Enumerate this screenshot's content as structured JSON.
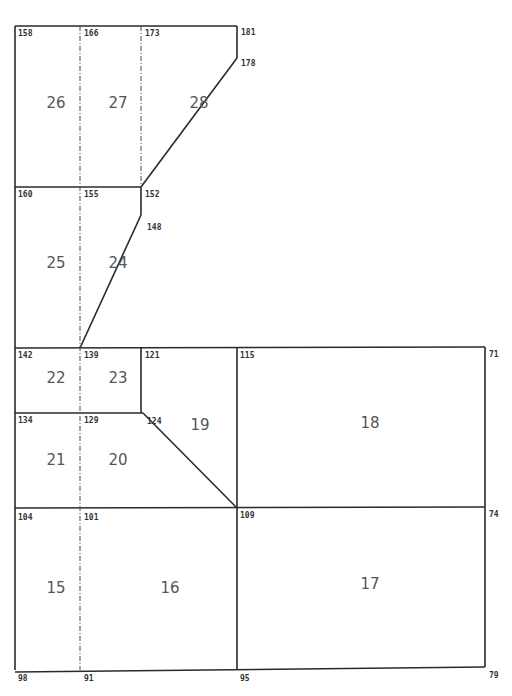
{
  "figure": {
    "type": "finite-element mesh diagram",
    "stroke_color": "#2a2a2a",
    "background": "#ffffff",
    "caption_partial": ""
  },
  "solid_edges": [
    {
      "x1": 15,
      "y1": 26,
      "x2": 237,
      "y2": 26
    },
    {
      "x1": 237,
      "y1": 26,
      "x2": 237,
      "y2": 58
    },
    {
      "x1": 237,
      "y1": 58,
      "x2": 141,
      "y2": 187
    },
    {
      "x1": 15,
      "y1": 26,
      "x2": 15,
      "y2": 670
    },
    {
      "x1": 15,
      "y1": 187,
      "x2": 141,
      "y2": 187
    },
    {
      "x1": 141,
      "y1": 187,
      "x2": 141,
      "y2": 215
    },
    {
      "x1": 141,
      "y1": 215,
      "x2": 80,
      "y2": 348
    },
    {
      "x1": 15,
      "y1": 348,
      "x2": 485,
      "y2": 347
    },
    {
      "x1": 15,
      "y1": 413,
      "x2": 143,
      "y2": 413
    },
    {
      "x1": 141,
      "y1": 348,
      "x2": 141,
      "y2": 413
    },
    {
      "x1": 143,
      "y1": 413,
      "x2": 237,
      "y2": 508
    },
    {
      "x1": 15,
      "y1": 508,
      "x2": 485,
      "y2": 507
    },
    {
      "x1": 15,
      "y1": 672,
      "x2": 485,
      "y2": 667
    },
    {
      "x1": 485,
      "y1": 347,
      "x2": 485,
      "y2": 667
    },
    {
      "x1": 237,
      "y1": 348,
      "x2": 237,
      "y2": 670
    }
  ],
  "dashed_edges": [
    {
      "x1": 80,
      "y1": 26,
      "x2": 80,
      "y2": 670
    },
    {
      "x1": 141,
      "y1": 26,
      "x2": 141,
      "y2": 187
    }
  ],
  "node_labels": [
    {
      "id": "158",
      "x": 18,
      "y": 36
    },
    {
      "id": "166",
      "x": 84,
      "y": 36
    },
    {
      "id": "173",
      "x": 145,
      "y": 36
    },
    {
      "id": "181",
      "x": 241,
      "y": 35
    },
    {
      "id": "178",
      "x": 241,
      "y": 66
    },
    {
      "id": "160",
      "x": 18,
      "y": 197
    },
    {
      "id": "155",
      "x": 84,
      "y": 197
    },
    {
      "id": "152",
      "x": 145,
      "y": 197
    },
    {
      "id": "148",
      "x": 147,
      "y": 230
    },
    {
      "id": "142",
      "x": 18,
      "y": 358
    },
    {
      "id": "139",
      "x": 84,
      "y": 358
    },
    {
      "id": "121",
      "x": 145,
      "y": 358
    },
    {
      "id": "115",
      "x": 240,
      "y": 358
    },
    {
      "id": "71",
      "x": 489,
      "y": 357
    },
    {
      "id": "134",
      "x": 18,
      "y": 423
    },
    {
      "id": "129",
      "x": 84,
      "y": 423
    },
    {
      "id": "124",
      "x": 147,
      "y": 424
    },
    {
      "id": "104",
      "x": 18,
      "y": 520
    },
    {
      "id": "101",
      "x": 84,
      "y": 520
    },
    {
      "id": "109",
      "x": 240,
      "y": 518
    },
    {
      "id": "74",
      "x": 489,
      "y": 517
    },
    {
      "id": "98",
      "x": 18,
      "y": 681
    },
    {
      "id": "91",
      "x": 84,
      "y": 681
    },
    {
      "id": "95",
      "x": 240,
      "y": 681
    },
    {
      "id": "79",
      "x": 489,
      "y": 678
    }
  ],
  "element_labels": [
    {
      "id": "26",
      "x": 56,
      "y": 108
    },
    {
      "id": "27",
      "x": 118,
      "y": 108
    },
    {
      "id": "28",
      "x": 199,
      "y": 108
    },
    {
      "id": "25",
      "x": 56,
      "y": 268
    },
    {
      "id": "24",
      "x": 118,
      "y": 268
    },
    {
      "id": "22",
      "x": 56,
      "y": 383
    },
    {
      "id": "23",
      "x": 118,
      "y": 383
    },
    {
      "id": "19",
      "x": 200,
      "y": 430
    },
    {
      "id": "18",
      "x": 370,
      "y": 428
    },
    {
      "id": "21",
      "x": 56,
      "y": 465
    },
    {
      "id": "20",
      "x": 118,
      "y": 465
    },
    {
      "id": "15",
      "x": 56,
      "y": 593
    },
    {
      "id": "16",
      "x": 170,
      "y": 593
    },
    {
      "id": "17",
      "x": 370,
      "y": 589
    }
  ]
}
